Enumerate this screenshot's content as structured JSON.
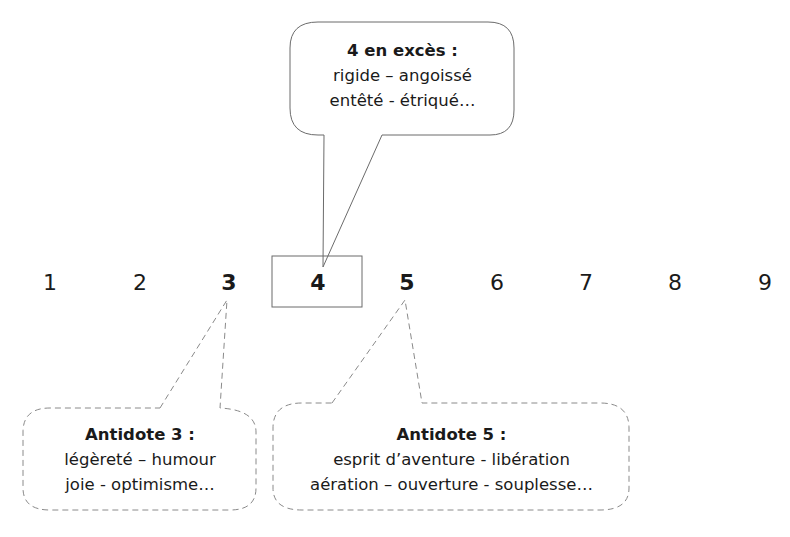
{
  "scale": {
    "numbers": [
      {
        "label": "1",
        "x": 50,
        "bold": false
      },
      {
        "label": "2",
        "x": 140,
        "bold": false
      },
      {
        "label": "3",
        "x": 229,
        "bold": true
      },
      {
        "label": "4",
        "x": 318,
        "bold": true,
        "boxed": true
      },
      {
        "label": "5",
        "x": 407,
        "bold": true
      },
      {
        "label": "6",
        "x": 497,
        "bold": false
      },
      {
        "label": "7",
        "x": 586,
        "bold": false
      },
      {
        "label": "8",
        "x": 675,
        "bold": false
      },
      {
        "label": "9",
        "x": 765,
        "bold": false
      }
    ]
  },
  "callouts": {
    "excess": {
      "title": "4 en excès :",
      "line1": "rigide – angoissé",
      "line2": "entêté - étriqué…",
      "style": "solid"
    },
    "antidote3": {
      "title": "Antidote 3 :",
      "line1": "légèreté – humour",
      "line2": "joie - optimisme…",
      "style": "dashed"
    },
    "antidote5": {
      "title": "Antidote 5 :",
      "line1": "esprit d’aventure - libération",
      "line2": "aération – ouverture - souplesse…",
      "style": "dashed"
    }
  },
  "colors": {
    "text": "#1a1a1a",
    "solid_stroke": "#6b6b6b",
    "dashed_stroke": "#8a8a8a",
    "background": "#ffffff"
  }
}
